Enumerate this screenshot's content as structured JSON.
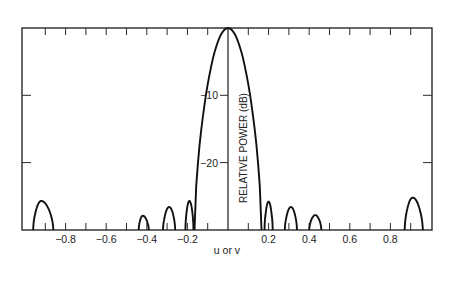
{
  "chart_data": {
    "type": "line",
    "title": "",
    "xlabel": "u or v",
    "ylabel": "RELATIVE POWER (dB)",
    "xlim": [
      -1.0,
      1.0
    ],
    "ylim": [
      -30,
      0
    ],
    "x_ticks": [
      -0.8,
      -0.6,
      -0.4,
      -0.2,
      0.2,
      0.4,
      0.6,
      0.8
    ],
    "x_tick_labels": [
      "−0.8",
      "−0.6",
      "−0.4",
      "−0.2",
      "0.2",
      "0.4",
      "0.6",
      "0.8"
    ],
    "y_ticks": [
      -10,
      -20
    ],
    "y_tick_labels": [
      "−10",
      "−20"
    ],
    "grid": false,
    "legend": null,
    "series": [
      {
        "name": "Main lobe",
        "lobes": [
          {
            "center": 0.0,
            "start": -0.165,
            "end": 0.165,
            "peak_db": 0.0
          }
        ]
      },
      {
        "name": "Sidelobes",
        "lobes": [
          {
            "center": -0.92,
            "start": -0.96,
            "end": -0.86,
            "peak_db": -25.7
          },
          {
            "center": -0.42,
            "start": -0.44,
            "end": -0.39,
            "peak_db": -27.9
          },
          {
            "center": -0.29,
            "start": -0.32,
            "end": -0.26,
            "peak_db": -26.6
          },
          {
            "center": -0.19,
            "start": -0.21,
            "end": -0.17,
            "peak_db": -25.7
          },
          {
            "center": 0.2,
            "start": 0.18,
            "end": 0.22,
            "peak_db": -25.8
          },
          {
            "center": 0.31,
            "start": 0.28,
            "end": 0.34,
            "peak_db": -26.6
          },
          {
            "center": 0.43,
            "start": 0.4,
            "end": 0.46,
            "peak_db": -27.8
          },
          {
            "center": 0.91,
            "start": 0.87,
            "end": 0.96,
            "peak_db": -25.2
          }
        ]
      }
    ]
  }
}
